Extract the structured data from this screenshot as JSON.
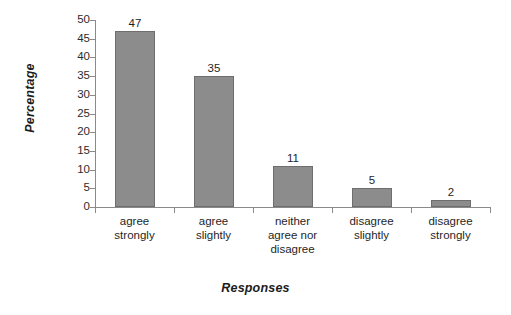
{
  "chart_data": {
    "type": "bar",
    "title": "",
    "subtitle": "",
    "xlabel": "Responses",
    "ylabel": "Percentage",
    "categories": [
      "agree\nstrongly",
      "agree\nslightly",
      "neither\nagree nor\ndisagree",
      "disagree\nslightly",
      "disagree\nstrongly"
    ],
    "values": [
      47,
      35,
      11,
      5,
      2
    ],
    "value_labels": [
      "47",
      "35",
      "11",
      "5",
      "2"
    ],
    "ylim": [
      0,
      50
    ],
    "ytick_values": [
      0,
      5,
      10,
      15,
      20,
      25,
      30,
      35,
      40,
      45,
      50
    ],
    "ytick_labels": [
      "0",
      "5",
      "10",
      "15",
      "20",
      "25",
      "30",
      "35",
      "40",
      "45",
      "50"
    ],
    "grid": false,
    "legend": false,
    "legend_position": "none",
    "bar_color": "#8c8c8c",
    "bar_edge_color": "#6e6e6e",
    "axis_color": "#8a8a8a",
    "text_color": "#1f1f1f",
    "background": "#ffffff"
  }
}
